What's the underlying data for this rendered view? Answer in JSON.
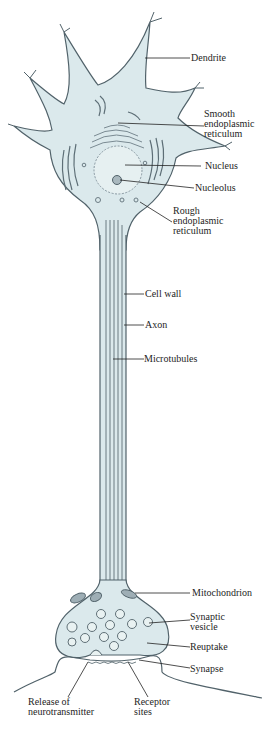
{
  "colors": {
    "cytoplasm": "#dbe9ec",
    "outline": "#51626a",
    "organelle": "#5d6e76",
    "leader": "#222222",
    "text": "#1e1e1e"
  },
  "labels": {
    "dendrite": "Dendrite",
    "smooth_er": "Smooth\nendoplasmic\nreticulum",
    "nucleus": "Nucleus",
    "nucleolus": "Nucleolus",
    "rough_er": "Rough\nendoplasmic\nreticulum",
    "cell_wall": "Cell wall",
    "axon": "Axon",
    "microtubules": "Microtubules",
    "mitochondrion": "Mitochondrion",
    "synaptic_vesicle": "Synaptic\nvesicle",
    "reuptake": "Reuptake",
    "synapse": "Synapse",
    "release_of_neurotransmitter": "Release of\nneurotransmitter",
    "receptor_sites": "Receptor\nsites"
  }
}
